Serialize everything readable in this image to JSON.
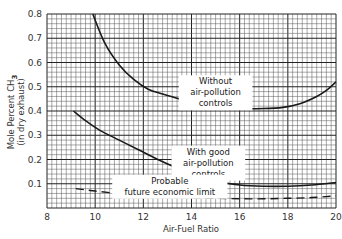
{
  "chart_data": {
    "type": "line",
    "title": "",
    "xlabel": "Air-Fuel Ratio",
    "ylabel": "Mole Percent CH3",
    "ylabel_sub": "(in dry exhaust)",
    "xlim": [
      8,
      20
    ],
    "ylim": [
      0,
      0.8
    ],
    "x_ticks": [
      8,
      10,
      12,
      14,
      16,
      18,
      20
    ],
    "y_ticks": [
      0.1,
      0.2,
      0.3,
      0.4,
      0.5,
      0.6,
      0.7,
      0.8
    ],
    "grid": true,
    "minor_x_step": 0.2,
    "minor_y_step": 0.02,
    "series": [
      {
        "name": "Without air-pollution controls",
        "style": "solid",
        "x": [
          9.9,
          10.4,
          11.0,
          11.6,
          12.2,
          12.8,
          13.5,
          14.2,
          15.0,
          16.0,
          17.0,
          17.8,
          18.5,
          19.2,
          19.6,
          20.0
        ],
        "y": [
          0.8,
          0.68,
          0.59,
          0.53,
          0.49,
          0.47,
          0.45,
          0.435,
          0.42,
          0.41,
          0.41,
          0.415,
          0.43,
          0.46,
          0.485,
          0.52
        ]
      },
      {
        "name": "With good air-pollution controls",
        "style": "solid",
        "x": [
          9.1,
          9.6,
          10.2,
          11.0,
          11.8,
          12.6,
          13.4,
          14.2,
          15.0,
          16.0,
          17.0,
          18.0,
          19.0,
          20.0
        ],
        "y": [
          0.4,
          0.36,
          0.32,
          0.28,
          0.24,
          0.2,
          0.165,
          0.135,
          0.11,
          0.095,
          0.09,
          0.09,
          0.095,
          0.105
        ]
      },
      {
        "name": "Probable future economic limit",
        "style": "dashed",
        "x": [
          9.2,
          10.0,
          11.0,
          12.0,
          13.0,
          14.0,
          15.0,
          16.0,
          17.0,
          18.0,
          19.0,
          20.0
        ],
        "y": [
          0.08,
          0.07,
          0.06,
          0.055,
          0.048,
          0.043,
          0.04,
          0.038,
          0.038,
          0.04,
          0.043,
          0.05
        ]
      }
    ],
    "annotations": [
      {
        "lines": [
          "Without",
          "air-pollution",
          "controls"
        ],
        "x": 15.0,
        "y": 0.51
      },
      {
        "lines": [
          "With  good",
          "air-pollution",
          "controls"
        ],
        "x": 14.7,
        "y": 0.22
      },
      {
        "lines": [
          "Probable",
          "future economic limit"
        ],
        "x": 13.1,
        "y": 0.1
      }
    ]
  },
  "colors": {
    "background": "#ffffff",
    "grid_minor": "#555555",
    "grid_major": "#222222",
    "curve": "#1a1a1a"
  }
}
